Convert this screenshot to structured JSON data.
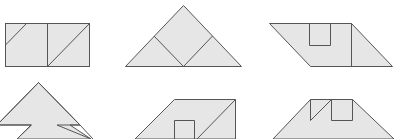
{
  "figure": {
    "fill_color": "#e6e6e6",
    "stroke_color": "#555555",
    "background": "#ffffff",
    "shapes": [
      {
        "id": "shape-1",
        "kind": "rectangle-split-with-diagonals"
      },
      {
        "id": "shape-2",
        "kind": "triangle-with-inner-square"
      },
      {
        "id": "shape-3",
        "kind": "parallelogram-with-notch"
      },
      {
        "id": "shape-4",
        "kind": "arrow-head-with-notches"
      },
      {
        "id": "shape-5",
        "kind": "parallelogram-with-inner-rect"
      },
      {
        "id": "shape-6",
        "kind": "trapezoid-with-notches"
      }
    ]
  }
}
